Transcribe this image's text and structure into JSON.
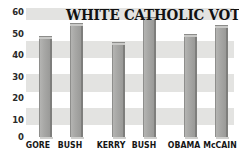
{
  "chart_data": {
    "type": "bar",
    "title": "WHITE CATHOLIC VOTING",
    "xlabel": "",
    "ylabel": "",
    "categories": [
      "GORE",
      "BUSH",
      "KERRY",
      "BUSH",
      "OBAMA",
      "McCAIN"
    ],
    "values": [
      47,
      53,
      44,
      56,
      48,
      52
    ],
    "ylim": [
      0,
      60
    ],
    "yticks": [
      0,
      10,
      20,
      30,
      40,
      50,
      60
    ],
    "ytick_labels": [
      "0",
      "10",
      "20",
      "30",
      "40",
      "50",
      "60"
    ],
    "grid": false,
    "background_bands": true,
    "legend": null,
    "bar_color": "#a8a8a6",
    "background_band_color": "#e3e3e1",
    "text_color": "#111111",
    "groups": [
      {
        "label_left": "GORE",
        "label_right": "BUSH"
      },
      {
        "label_left": "KERRY",
        "label_right": "BUSH"
      },
      {
        "label_left": "OBAMA",
        "label_right": "McCAIN"
      }
    ]
  }
}
